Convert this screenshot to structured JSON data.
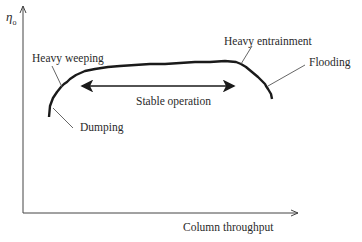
{
  "diagram": {
    "y_axis_label": "η",
    "y_axis_subscript": "o",
    "x_axis_label": "Column throughput",
    "annotations": {
      "heavy_weeping": "Heavy weeping",
      "dumping": "Dumping",
      "heavy_entrainment": "Heavy entrainment",
      "flooding": "Flooding",
      "stable_operation": "Stable operation"
    },
    "colors": {
      "line": "#1a1a1a",
      "axis": "#444444",
      "text": "#2a2a2a"
    }
  }
}
